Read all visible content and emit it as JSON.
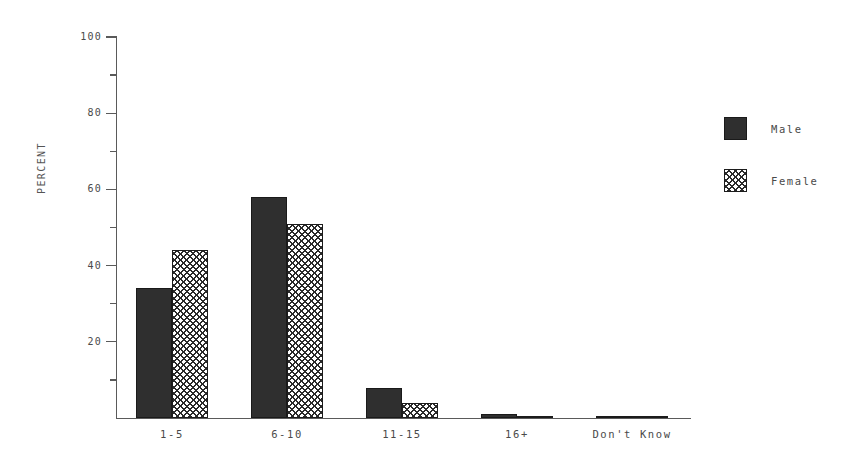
{
  "chart_data": {
    "type": "bar",
    "title": "",
    "subtitle": "",
    "xlabel": "",
    "ylabel": "PERCENT",
    "categories": [
      "1-5",
      "6-10",
      "11-15",
      "16+",
      "Don't Know"
    ],
    "series": [
      {
        "name": "Male",
        "fill": "solid",
        "color": "#2f2f2f",
        "values": [
          34,
          58,
          8,
          1,
          0.5
        ]
      },
      {
        "name": "Female",
        "fill": "crosshatch",
        "color": "#ffffff",
        "values": [
          44,
          51,
          4,
          0.3,
          0.5
        ]
      }
    ],
    "ylim": [
      0,
      100
    ],
    "ytick_values": [
      0,
      20,
      40,
      60,
      80,
      100
    ],
    "ytick_labels": [
      "0",
      "20",
      "40",
      "60",
      "80",
      "100"
    ],
    "yminor_tick_values": [
      10,
      30,
      50,
      70,
      90
    ],
    "grid": false,
    "legend_position": "right",
    "legend_entries": [
      "Male",
      "Female"
    ]
  },
  "axes": {
    "y_label": "PERCENT",
    "y_ticks": [
      {
        "value": 100,
        "label": "100"
      },
      {
        "value": 80,
        "label": "80"
      },
      {
        "value": 60,
        "label": "60"
      },
      {
        "value": 40,
        "label": "40"
      },
      {
        "value": 20,
        "label": "20"
      }
    ],
    "y_minor_ticks": [
      90,
      70,
      50,
      30,
      10
    ]
  },
  "legend": {
    "male_label": "Male",
    "female_label": "Female"
  }
}
